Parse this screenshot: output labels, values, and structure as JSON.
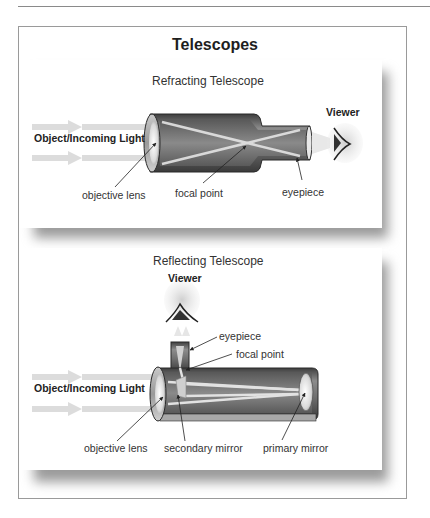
{
  "figure": {
    "title": "Telescopes",
    "panels": [
      {
        "id": "refracting",
        "subtitle": "Refracting Telescope",
        "labels": {
          "incoming_light": "Object/Incoming Light",
          "viewer": "Viewer",
          "objective_lens": "objective lens",
          "focal_point": "focal point",
          "eyepiece": "eyepiece"
        }
      },
      {
        "id": "reflecting",
        "subtitle": "Reflecting Telescope",
        "labels": {
          "incoming_light": "Object/Incoming Light",
          "viewer": "Viewer",
          "eyepiece": "eyepiece",
          "focal_point": "focal point",
          "objective_lens": "objective lens",
          "secondary_mirror": "secondary mirror",
          "primary_mirror": "primary mirror"
        }
      }
    ]
  },
  "colors": {
    "tube_dark": "#4a4a4a",
    "tube_mid": "#7a7a7a",
    "tube_light": "#b5b5b5",
    "light_ray": "#d8d8d8",
    "shadow": "#9a9a9a"
  }
}
